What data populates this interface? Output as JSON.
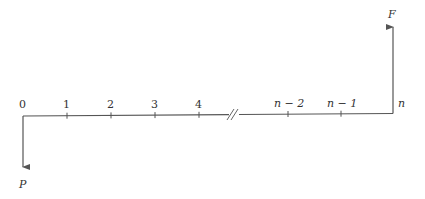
{
  "diagram": {
    "type": "cash-flow-diagram",
    "time_labels": [
      "0",
      "1",
      "2",
      "3",
      "4",
      "n − 2",
      "n − 1",
      "n"
    ],
    "present_value_label": "P",
    "future_value_label": "F",
    "break_symbol": "//",
    "colors": {
      "line": "#555555",
      "text": "#333333"
    }
  }
}
